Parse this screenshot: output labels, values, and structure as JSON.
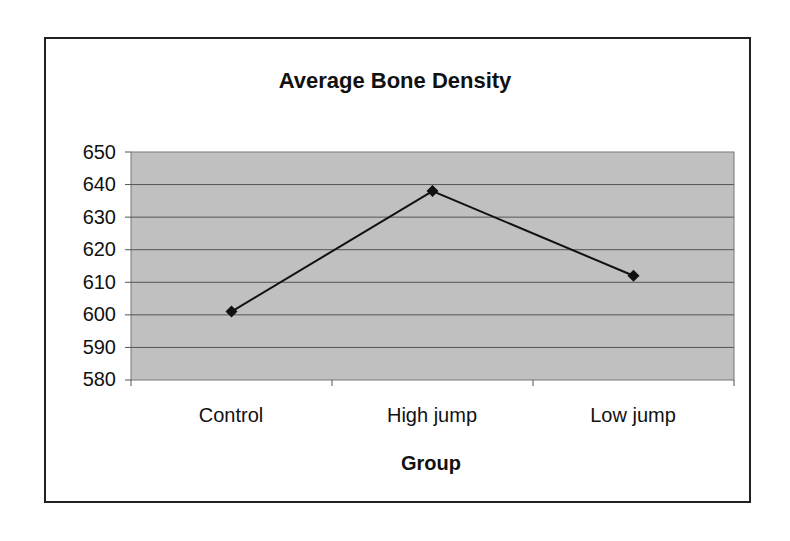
{
  "chart_data": {
    "type": "line",
    "title": "Average Bone Density",
    "xlabel": "Group",
    "ylabel": "",
    "categories": [
      "Control",
      "High jump",
      "Low jump"
    ],
    "series": [
      {
        "name": "Average Bone Density",
        "values": [
          601,
          638,
          612
        ]
      }
    ],
    "ylim": [
      580,
      650
    ],
    "yticks": [
      "650",
      "640",
      "630",
      "620",
      "610",
      "600",
      "590",
      "580"
    ],
    "grid": true,
    "legend": "none"
  },
  "colors": {
    "plot_bg": "#c0c0c0",
    "line": "#111111",
    "grid": "#555555"
  }
}
